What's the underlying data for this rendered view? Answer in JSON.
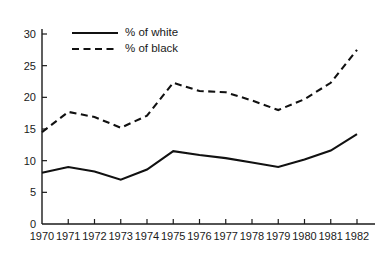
{
  "chart_data": {
    "type": "line",
    "title": "",
    "subtitle": "",
    "xlabel": "",
    "ylabel": "",
    "grid": false,
    "legend_position": "top-left",
    "x": [
      1970,
      1971,
      1972,
      1973,
      1974,
      1975,
      1976,
      1977,
      1978,
      1979,
      1980,
      1981,
      1982
    ],
    "categories": [
      "1970",
      "1971",
      "1972",
      "1973",
      "1974",
      "1975",
      "1976",
      "1977",
      "1978",
      "1979",
      "1980",
      "1981",
      "1982"
    ],
    "xlim": [
      1970,
      1982
    ],
    "ylim": [
      0,
      31
    ],
    "ytick_labels": [
      "0",
      "5",
      "10",
      "15",
      "20",
      "25",
      "30"
    ],
    "ytick_values": [
      0,
      5,
      10,
      15,
      20,
      25,
      30
    ],
    "series": [
      {
        "name": "% of white",
        "style": "solid",
        "color": "#111111",
        "values": [
          8.1,
          9.0,
          8.3,
          7.0,
          8.6,
          11.5,
          10.9,
          10.4,
          9.7,
          9.0,
          10.2,
          11.6,
          14.2
        ]
      },
      {
        "name": "% of black",
        "style": "dashed",
        "color": "#111111",
        "values": [
          14.5,
          17.7,
          16.9,
          15.2,
          17.1,
          22.3,
          21.0,
          20.8,
          19.5,
          18.0,
          19.7,
          22.3,
          27.5
        ]
      }
    ]
  },
  "legend": {
    "items": [
      {
        "label": "% of white",
        "style": "solid"
      },
      {
        "label": "% of black",
        "style": "dashed"
      }
    ]
  }
}
